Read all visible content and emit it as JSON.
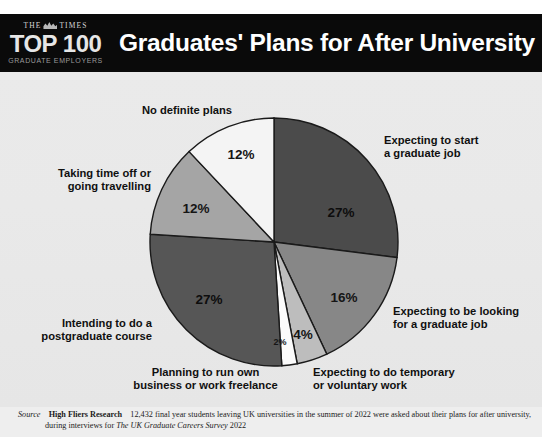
{
  "masthead": {
    "publication_prefix": "THE",
    "publication_suffix": "TIMES",
    "crest_icon": "times-crest-icon",
    "ranking": "TOP 100",
    "ranking_sub": "GRADUATE EMPLOYERS"
  },
  "header": {
    "title": "Graduates' Plans for After University in 2022"
  },
  "chart_data": {
    "type": "pie",
    "title": "Graduates' Plans for After University in 2022",
    "unit": "%",
    "total": 100,
    "start_angle_deg": 0,
    "direction": "clockwise",
    "legend": "callout-labels",
    "grid": false,
    "categories": [
      "Expecting to start a graduate job",
      "Expecting to be looking for a graduate job",
      "Expecting to do temporary or voluntary work",
      "Planning to run own business or work freelance",
      "Intending to do a postgraduate course",
      "Taking time off or going travelling",
      "No definite plans"
    ],
    "values": [
      27,
      16,
      4,
      2,
      27,
      12,
      12
    ],
    "value_labels": [
      "27%",
      "16%",
      "4%",
      "2%",
      "27%",
      "12%",
      "12%"
    ],
    "colors": [
      "#4b4b4b",
      "#878787",
      "#bdbdbd",
      "#fbfbfb",
      "#565656",
      "#a5a5a5",
      "#f4f4f4"
    ]
  },
  "labels": {
    "expecting_start": "Expecting to start\na graduate job",
    "expecting_looking": "Expecting to be looking\nfor a graduate job",
    "temporary_voluntary": "Expecting to do temporary\nor voluntary work",
    "own_business": "Planning to run own\nbusiness or work freelance",
    "postgraduate": "Intending to do a\npostgraduate course",
    "time_off": "Taking time off or\ngoing travelling",
    "no_plans": "No definite plans"
  },
  "percentages": {
    "start_job": "27%",
    "looking_job": "16%",
    "temporary": "4%",
    "business": "2%",
    "postgrad": "27%",
    "time_off": "12%",
    "no_plans": "12%"
  },
  "footer": {
    "source_label": "Source",
    "organisation": "High Fliers Research",
    "text_before": "12,432 final year students leaving UK universities in the summer of 2022 were asked about their plans for after university,",
    "text_line2_before": "during interviews for ",
    "survey_title": "The UK Graduate Careers Survey",
    "text_line2_after": " 2022"
  },
  "palette": {
    "header_bg": "#0a0a0a",
    "header_text": "#ffffff",
    "body_bg": "#e9e9e9",
    "stroke": "#1a1a1a"
  }
}
